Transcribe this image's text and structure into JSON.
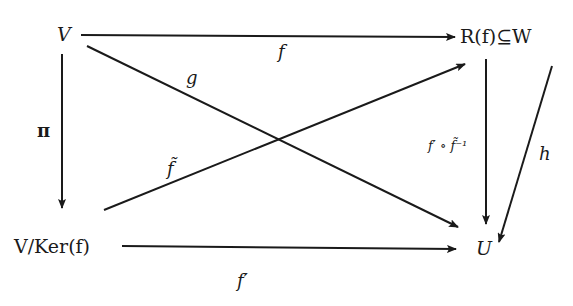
{
  "diagram": {
    "type": "commutative-diagram",
    "nodes": {
      "V": "V",
      "RfW": "R(f)⊆W",
      "VKer": "V/Ker(f)",
      "U": "U"
    },
    "edges": [
      {
        "from": "V",
        "to": "RfW",
        "label": "f"
      },
      {
        "from": "V",
        "to": "U",
        "label": "g"
      },
      {
        "from": "V",
        "to": "VKer",
        "label": "π"
      },
      {
        "from": "VKer",
        "to": "RfW",
        "label": "f̃"
      },
      {
        "from": "VKer",
        "to": "U",
        "label": "f′"
      },
      {
        "from": "RfW",
        "to": "U",
        "label": "f′ ∘ f̃⁻¹"
      },
      {
        "from": "RfW",
        "to": "U",
        "label": "h"
      }
    ],
    "labels": {
      "f": "f",
      "g": "g",
      "pi": "π",
      "ftilde": "f̃",
      "fprime": "f′",
      "composite": "f′ ∘ f̃⁻¹",
      "h": "h"
    },
    "colors": {
      "ink": "#1a1a1a",
      "background": "#ffffff"
    }
  }
}
